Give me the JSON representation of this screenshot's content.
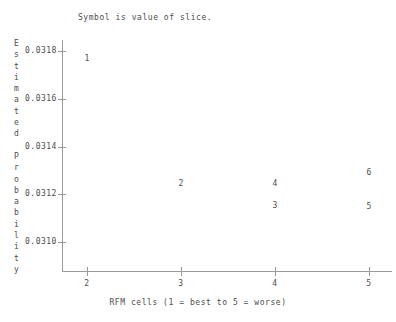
{
  "chart_data": {
    "type": "scatter",
    "title": "Symbol is value of slice.",
    "xlabel": "RFM cells (1 = best to 5 = worse)",
    "ylabel": "Estimated Probability",
    "ylabel_chars": [
      "E",
      "s",
      "t",
      "i",
      "m",
      "a",
      "t",
      "e",
      "d",
      " ",
      "P",
      "r",
      "o",
      "b",
      "a",
      "b",
      "i",
      "l",
      "i",
      "t",
      "y"
    ],
    "grid": false,
    "legend": "none",
    "xlim": [
      1.74,
      5.24
    ],
    "ylim": [
      0.03088,
      0.031845
    ],
    "xticks": [
      2,
      3,
      4,
      5
    ],
    "xtick_labels": [
      "2",
      "3",
      "4",
      "5"
    ],
    "yticks": [
      0.0318,
      0.0316,
      0.0314,
      0.0312,
      0.031
    ],
    "ytick_labels": [
      "0.0318",
      "0.0316",
      "0.0314",
      "0.0312",
      "0.0310"
    ],
    "point_label_note": "Each plotted marker is the digit of the slice value",
    "points": [
      {
        "label": "1",
        "x": 2,
        "y": 0.031765
      },
      {
        "label": "2",
        "x": 3,
        "y": 0.031245
      },
      {
        "label": "4",
        "x": 4,
        "y": 0.031245
      },
      {
        "label": "3",
        "x": 4,
        "y": 0.031153
      },
      {
        "label": "6",
        "x": 5,
        "y": 0.031289
      },
      {
        "label": "5",
        "x": 5,
        "y": 0.031147
      }
    ],
    "series": [
      {
        "name": "slice value",
        "x": [
          2,
          3,
          4,
          4,
          5,
          5
        ],
        "values": [
          0.031765,
          0.031245,
          0.031245,
          0.031153,
          0.031289,
          0.031147
        ],
        "labels": [
          "1",
          "2",
          "4",
          "3",
          "6",
          "5"
        ]
      }
    ],
    "colors": {
      "axis": "#9a9a9a",
      "text": "#4d4d4d",
      "background": "#ffffff"
    }
  }
}
